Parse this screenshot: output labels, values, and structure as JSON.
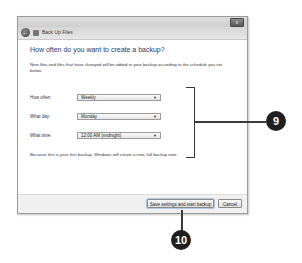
{
  "window": {
    "nav_title": "Back Up Files",
    "close_label": "x",
    "back_icon": "back-arrow-icon"
  },
  "content": {
    "heading": "How often do you want to create a backup?",
    "description": "New files and files that have changed will be added to your backup according to the schedule you set below.",
    "fields": [
      {
        "label": "How often:",
        "value": "Weekly"
      },
      {
        "label": "What day:",
        "value": "Monday"
      },
      {
        "label": "What time:",
        "value": "12:00 AM (midnight)"
      }
    ],
    "note": "Because this is your first backup, Windows will create a new, full backup now."
  },
  "footer": {
    "save_label": "Save settings and start backup",
    "cancel_label": "Cancel"
  },
  "callouts": {
    "schedule_callout": "9",
    "save_callout": "10"
  },
  "colors": {
    "heading": "#1e3a6e",
    "callout_bg": "#1f1f1f"
  }
}
